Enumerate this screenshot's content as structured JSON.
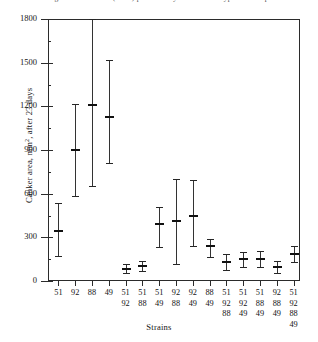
{
  "figure": {
    "top_caption_partial": "Fig. 2. Canker area (mm2) produced by isolates of Cryphonectria parasitica",
    "x_axis_title": "Strains",
    "y_axis_title_pre": "Canker area, mm",
    "y_axis_title_sup": "2",
    "y_axis_title_post": ", after 23 days"
  },
  "chart_data": {
    "type": "scatter",
    "title": "",
    "xlabel": "Strains",
    "ylabel": "Canker area, mm2, after 23 days",
    "ylim": [
      0,
      1800
    ],
    "yticks": [
      0,
      300,
      600,
      900,
      1200,
      1500,
      1800
    ],
    "ytick_labels": [
      "0",
      "300",
      "600",
      "900",
      "1200",
      "1500",
      "1800"
    ],
    "grid": false,
    "legend": null,
    "marker": "mean with vertical range bar (min-max whiskers)",
    "categories": [
      "51",
      "92",
      "88",
      "49",
      "51/92",
      "51/88",
      "51/49",
      "92/88",
      "92/49",
      "88/49",
      "51/92/88",
      "51/92/49",
      "51/88/49",
      "92/88/49",
      "51/92/88/49"
    ],
    "category_label_stacks": [
      [
        "51"
      ],
      [
        "92"
      ],
      [
        "88"
      ],
      [
        "49"
      ],
      [
        "51",
        "92"
      ],
      [
        "51",
        "88"
      ],
      [
        "51",
        "49"
      ],
      [
        "92",
        "88"
      ],
      [
        "92",
        "49"
      ],
      [
        "88",
        "49"
      ],
      [
        "51",
        "92",
        "88"
      ],
      [
        "51",
        "92",
        "49"
      ],
      [
        "51",
        "88",
        "49"
      ],
      [
        "92",
        "88",
        "49"
      ],
      [
        "51",
        "92",
        "88",
        "49"
      ]
    ],
    "series": [
      {
        "name": "Canker area",
        "values": [
          343,
          900,
          1209,
          1128,
          85,
          100,
          390,
          415,
          450,
          240,
          130,
          150,
          150,
          95,
          185
        ],
        "lower": [
          172,
          584,
          652,
          810,
          55,
          70,
          235,
          118,
          240,
          165,
          75,
          95,
          95,
          55,
          130
        ],
        "upper": [
          535,
          1215,
          1800,
          1518,
          118,
          140,
          505,
          700,
          695,
          290,
          185,
          200,
          205,
          140,
          240
        ]
      }
    ]
  }
}
